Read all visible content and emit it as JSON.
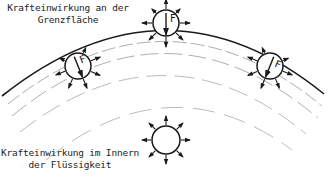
{
  "labels": {
    "surface_line1": "Krafteinwirkung an der",
    "surface_line2": "Grenzfläche",
    "interior_line1": "Krafteinwirkung im Innern",
    "interior_line2": "der Flüssigkeit"
  },
  "force_symbol": "F",
  "colors": {
    "line": "#1a1a1a",
    "dashed": "#888888",
    "background": "#ffffff"
  },
  "molecules": [
    {
      "id": "surface-left",
      "position": "surface",
      "has_resultant_force": true
    },
    {
      "id": "surface-center",
      "position": "surface",
      "has_resultant_force": true
    },
    {
      "id": "surface-right",
      "position": "surface",
      "has_resultant_force": true
    },
    {
      "id": "interior",
      "position": "interior",
      "has_resultant_force": false
    }
  ]
}
